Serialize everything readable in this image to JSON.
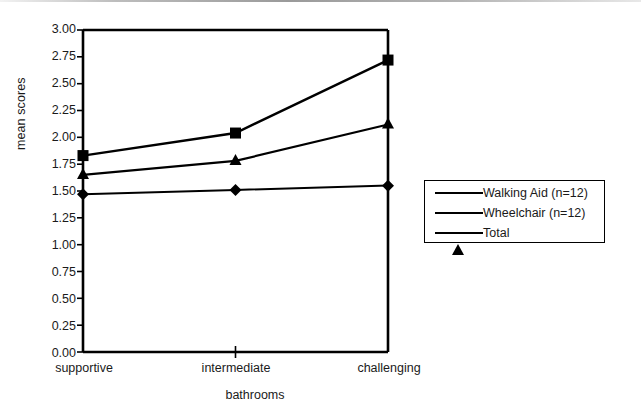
{
  "chart_data": {
    "type": "line",
    "title": "",
    "xlabel": "bathrooms",
    "ylabel": "mean scores",
    "categories": [
      "supportive",
      "intermediate",
      "challenging"
    ],
    "ylim": [
      0.0,
      3.0
    ],
    "ytick_labels": [
      "3.00",
      "2.75",
      "2.50",
      "2.25",
      "2.00",
      "1.75",
      "1.50",
      "1.25",
      "1.00",
      "0.75",
      "0.50",
      "0.25",
      "0.00"
    ],
    "ytick_values": [
      3.0,
      2.75,
      2.5,
      2.25,
      2.0,
      1.75,
      1.5,
      1.25,
      1.0,
      0.75,
      0.5,
      0.25,
      0.0
    ],
    "grid": false,
    "legend_position": "right-outside",
    "series": [
      {
        "name": "Walking Aid (n=12)",
        "marker": "diamond",
        "values": [
          1.47,
          1.51,
          1.55
        ]
      },
      {
        "name": "Wheelchair (n=12)",
        "marker": "square",
        "values": [
          1.83,
          2.04,
          2.72
        ]
      },
      {
        "name": "Total",
        "marker": "triangle",
        "values": [
          1.65,
          1.78,
          2.12
        ]
      }
    ],
    "line_color": "#000000",
    "marker_color": "#000000",
    "axis_color": "#000000",
    "background": "#ffffff"
  },
  "legend": {
    "items": [
      {
        "label": "Walking Aid (n=12)",
        "marker": "diamond-marker"
      },
      {
        "label": "Wheelchair (n=12)",
        "marker": "square-marker"
      },
      {
        "label": "Total",
        "marker": "triangle-marker"
      }
    ]
  }
}
